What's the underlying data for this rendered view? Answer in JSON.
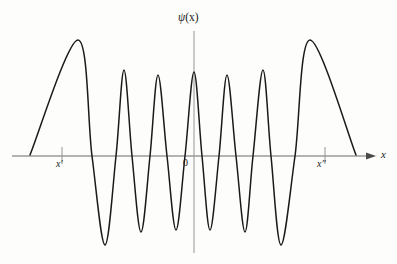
{
  "figure": {
    "title": "",
    "background_color": "#fdfdfc",
    "curve_color": "#1a1a1a",
    "axis_color": "#555555"
  },
  "labels": {
    "y_axis": "ψ",
    "y_axis_arg": "(x)",
    "x_axis": "x",
    "origin": "0",
    "turning_point_left": "x′",
    "turning_point_right": "x″"
  },
  "chart_data": {
    "type": "line",
    "title": "",
    "xlabel": "x",
    "ylabel": "ψ(x)",
    "grid": false,
    "legend": null,
    "axis_geometry": {
      "x_axis_y_px": 156,
      "y_axis_x_px": 194,
      "x_axis_start_px": 12,
      "x_axis_arrow_tip_px": 376,
      "y_axis_top_px": 30,
      "y_axis_bottom_px": 253
    },
    "tick_marks": [
      {
        "label": "x′",
        "x_px": 62
      },
      {
        "label": "x″",
        "x_px": 325
      }
    ],
    "series": [
      {
        "name": "ψ(x)",
        "extrema_px": [
          {
            "kind": "tail-start",
            "x": 30,
            "y": 155
          },
          {
            "kind": "peak",
            "x": 78,
            "y": 40
          },
          {
            "kind": "trough",
            "x": 105,
            "y": 245
          },
          {
            "kind": "peak",
            "x": 124,
            "y": 70
          },
          {
            "kind": "trough",
            "x": 141,
            "y": 232
          },
          {
            "kind": "peak",
            "x": 158,
            "y": 75
          },
          {
            "kind": "trough",
            "x": 176,
            "y": 230
          },
          {
            "kind": "peak",
            "x": 194,
            "y": 72
          },
          {
            "kind": "trough",
            "x": 210,
            "y": 230
          },
          {
            "kind": "peak",
            "x": 227,
            "y": 75
          },
          {
            "kind": "trough",
            "x": 245,
            "y": 232
          },
          {
            "kind": "peak",
            "x": 263,
            "y": 70
          },
          {
            "kind": "trough",
            "x": 281,
            "y": 245
          },
          {
            "kind": "peak",
            "x": 310,
            "y": 40
          },
          {
            "kind": "tail-end",
            "x": 356,
            "y": 155
          }
        ],
        "zero_crossings_px": [
          30,
          92,
          116,
          132,
          150,
          167,
          185,
          202,
          219,
          236,
          253,
          271,
          295,
          356
        ],
        "amplitude_envelope_note": "amplitude largest at the turning points x' and x'', smallest near the origin"
      }
    ]
  }
}
